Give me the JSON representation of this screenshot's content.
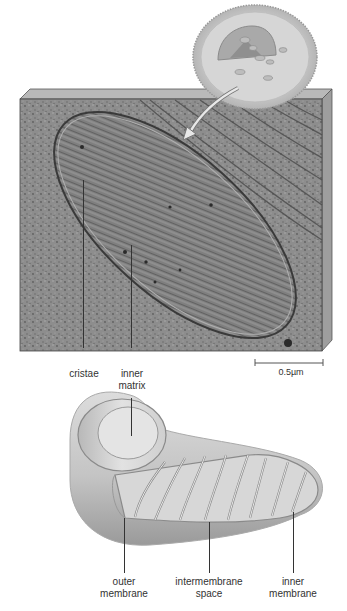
{
  "figure": {
    "panels": [
      {
        "id": "micrograph",
        "description": "Electron micrograph of a mitochondrion shown as a 3D block, with a cell inset at top right and an arrow pointing to the mitochondrion",
        "labels": {
          "cristae": "cristae",
          "inner_matrix_line1": "inner",
          "inner_matrix_line2": "matrix"
        },
        "scale_bar": "0.5µm"
      },
      {
        "id": "cutaway",
        "description": "Cutaway illustration of a mitochondrion",
        "labels": {
          "outer_membrane_line1": "outer",
          "outer_membrane_line2": "membrane",
          "intermembrane_line1": "intermembrane",
          "intermembrane_line2": "space",
          "inner_membrane_line1": "inner",
          "inner_membrane_line2": "membrane"
        }
      }
    ]
  },
  "colors": {
    "block_face": "#8a8a8a",
    "block_top": "#b9b9b9",
    "block_side": "#9e9e9e",
    "mito_body": "#c9c9c9",
    "label_text": "#333333"
  }
}
